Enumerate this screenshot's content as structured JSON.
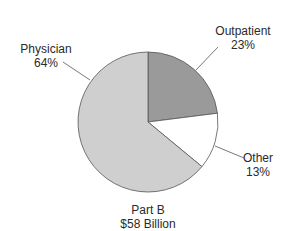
{
  "chart_data": {
    "type": "pie",
    "title": "Part B",
    "subtitle": "$58 Billion",
    "slices": [
      {
        "label": "Outpatient",
        "value": 23,
        "display": "23%",
        "color": "#9a9a9a"
      },
      {
        "label": "Other",
        "value": 13,
        "display": "13%",
        "color": "#ffffff"
      },
      {
        "label": "Physician",
        "value": 64,
        "display": "64%",
        "color": "#cfcfcf"
      }
    ],
    "legend": "none (leader-line labels)",
    "start_angle_deg": 0,
    "direction": "clockwise from 12 o'clock"
  },
  "labels": {
    "physician_name": "Physician",
    "physician_pct": "64%",
    "outpatient_name": "Outpatient",
    "outpatient_pct": "23%",
    "other_name": "Other",
    "other_pct": "13%",
    "caption_line1": "Part B",
    "caption_line2": "$58 Billion"
  }
}
